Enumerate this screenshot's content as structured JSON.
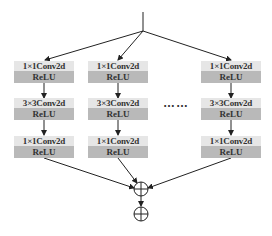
{
  "diagram": {
    "type": "multi-branch convolution block",
    "branches": [
      {
        "id": "branch-1",
        "layers": [
          {
            "conv": "1×1Conv2d",
            "act": "ReLU"
          },
          {
            "conv": "3×3Conv2d",
            "act": "ReLU"
          },
          {
            "conv": "1×1Conv2d",
            "act": "ReLU"
          }
        ]
      },
      {
        "id": "branch-2",
        "layers": [
          {
            "conv": "1×1Conv2d",
            "act": "ReLU"
          },
          {
            "conv": "3×3Conv2d",
            "act": "ReLU"
          },
          {
            "conv": "1×1Conv2d",
            "act": "ReLU"
          }
        ]
      },
      {
        "id": "branch-n",
        "layers": [
          {
            "conv": "1×1Conv2d",
            "act": "ReLU"
          },
          {
            "conv": "3×3Conv2d",
            "act": "ReLU"
          },
          {
            "conv": "1×1Conv2d",
            "act": "ReLU"
          }
        ]
      }
    ],
    "ellipsis": "……",
    "merge_nodes": [
      "sum-1",
      "sum-2"
    ],
    "colors": {
      "conv_fill": "#e6e6e6",
      "relu_fill": "#b9b9b9",
      "line": "#222222",
      "text": "#333333"
    }
  }
}
